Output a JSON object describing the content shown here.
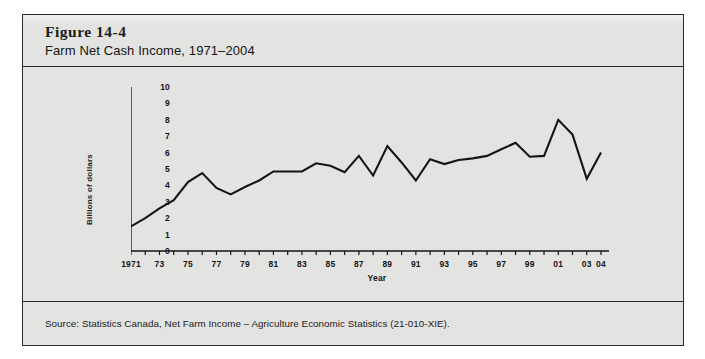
{
  "figure": {
    "number": "Figure 14-4",
    "title": "Farm Net Cash Income, 1971–2004",
    "source": "Source: Statistics Canada, Net Farm Income – Agriculture Economic Statistics (21-010-XIE)."
  },
  "colors": {
    "panel_background": "#e3e3e1",
    "border": "#2b2b2b",
    "line": "#151515",
    "text": "#161616"
  },
  "chart_data": {
    "type": "line",
    "title": "Farm Net Cash Income, 1971–2004",
    "xlabel": "Year",
    "ylabel": "Billions of dollars",
    "xlim": [
      1971,
      2004
    ],
    "ylim": [
      0,
      10
    ],
    "ytick_values": [
      0,
      1,
      2,
      3,
      4,
      5,
      6,
      7,
      8,
      9,
      10
    ],
    "ytick_labels": [
      "0",
      "1",
      "2",
      "3",
      "4",
      "5",
      "6",
      "7",
      "8",
      "9",
      "10"
    ],
    "xtick_values": [
      1971,
      1972,
      1973,
      1974,
      1975,
      1976,
      1977,
      1978,
      1979,
      1980,
      1981,
      1982,
      1983,
      1984,
      1985,
      1986,
      1987,
      1988,
      1989,
      1990,
      1991,
      1992,
      1993,
      1994,
      1995,
      1996,
      1997,
      1998,
      1999,
      2000,
      2001,
      2002,
      2003,
      2004
    ],
    "xtick_labels_shown": {
      "1971": "1971",
      "1973": "73",
      "1975": "75",
      "1977": "77",
      "1979": "79",
      "1981": "81",
      "1983": "83",
      "1985": "85",
      "1987": "87",
      "1989": "89",
      "1991": "91",
      "1993": "93",
      "1995": "95",
      "1997": "97",
      "1999": "99",
      "2001": "01",
      "2003": "03",
      "2004": "04"
    },
    "grid": false,
    "legend": "none",
    "series": [
      {
        "name": "Farm Net Cash Income",
        "unit": "billions of dollars",
        "x": [
          1971,
          1972,
          1973,
          1974,
          1975,
          1976,
          1977,
          1978,
          1979,
          1980,
          1981,
          1982,
          1983,
          1984,
          1985,
          1986,
          1987,
          1988,
          1989,
          1990,
          1991,
          1992,
          1993,
          1994,
          1995,
          1996,
          1997,
          1998,
          1999,
          2000,
          2001,
          2002,
          2003,
          2004
        ],
        "values": [
          1.5,
          2.0,
          2.6,
          3.1,
          4.2,
          4.75,
          3.85,
          3.45,
          3.9,
          4.3,
          4.85,
          4.85,
          4.85,
          5.35,
          5.2,
          4.8,
          5.8,
          4.6,
          6.4,
          5.4,
          4.3,
          5.6,
          5.3,
          5.55,
          5.65,
          5.8,
          6.2,
          6.6,
          5.75,
          5.8,
          8.0,
          7.1,
          4.4,
          6.0
        ]
      }
    ]
  }
}
